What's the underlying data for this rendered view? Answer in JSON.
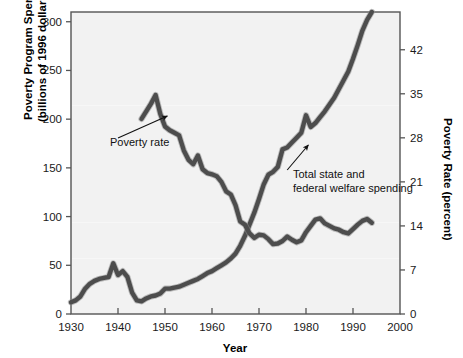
{
  "chart_data": {
    "type": "line",
    "title": "",
    "xlabel": "Year",
    "ylabel": "Poverty Program Spending (billions of 1996 dollars)",
    "y2label": "Poverty Rate (percent)",
    "xlim": [
      1930,
      2000
    ],
    "xticks": [
      1930,
      1940,
      1950,
      1960,
      1970,
      1980,
      1990,
      2000
    ],
    "xtick_labels": [
      "1930",
      "1940",
      "1950",
      "1960",
      "1970",
      "1980",
      "1990",
      "2000"
    ],
    "ylim": [
      0,
      310
    ],
    "yticks": [
      0,
      50,
      100,
      150,
      200,
      250,
      300
    ],
    "ytick_labels": [
      "0",
      "50",
      "100",
      "150",
      "200",
      "250",
      "300"
    ],
    "y2lim": [
      0,
      48
    ],
    "y2ticks": [
      0,
      7,
      14,
      21,
      28,
      35,
      42
    ],
    "y2tick_labels": [
      "0",
      "7",
      "14",
      "21",
      "28",
      "35",
      "42"
    ],
    "grid": false,
    "legend_position": "inline-annotations",
    "line_color": "#4d4d4d",
    "plot_background": "#f2f2f2",
    "series": [
      {
        "name": "Total state and federal welfare spending",
        "axis": "left",
        "units": "billions of 1996 dollars",
        "x": [
          1930,
          1931,
          1932,
          1933,
          1934,
          1935,
          1936,
          1937,
          1938,
          1939,
          1940,
          1941,
          1942,
          1943,
          1944,
          1945,
          1946,
          1947,
          1948,
          1949,
          1950,
          1951,
          1952,
          1953,
          1954,
          1955,
          1956,
          1957,
          1958,
          1959,
          1960,
          1961,
          1962,
          1963,
          1964,
          1965,
          1966,
          1967,
          1968,
          1969,
          1970,
          1971,
          1972,
          1973,
          1974,
          1975,
          1976,
          1977,
          1978,
          1979,
          1980,
          1981,
          1982,
          1983,
          1984,
          1985,
          1986,
          1987,
          1988,
          1989,
          1990,
          1991,
          1992,
          1993,
          1994
        ],
        "y": [
          12,
          14,
          18,
          26,
          31,
          34,
          36,
          37,
          38,
          52,
          40,
          44,
          38,
          22,
          14,
          13,
          16,
          18,
          19,
          21,
          26,
          26,
          27,
          28,
          30,
          32,
          34,
          36,
          39,
          42,
          44,
          47,
          50,
          53,
          57,
          62,
          70,
          80,
          92,
          104,
          118,
          133,
          143,
          146,
          151,
          169,
          171,
          176,
          181,
          186,
          204,
          192,
          196,
          202,
          208,
          215,
          222,
          231,
          240,
          249,
          262,
          276,
          291,
          302,
          310
        ]
      },
      {
        "name": "Poverty rate",
        "axis": "right",
        "units": "percent",
        "x": [
          1945,
          1946,
          1947,
          1948,
          1949,
          1950,
          1951,
          1952,
          1953,
          1954,
          1955,
          1956,
          1957,
          1958,
          1959,
          1960,
          1961,
          1962,
          1963,
          1964,
          1965,
          1966,
          1967,
          1968,
          1969,
          1970,
          1971,
          1972,
          1973,
          1974,
          1975,
          1976,
          1977,
          1978,
          1979,
          1980,
          1981,
          1982,
          1983,
          1984,
          1985,
          1986,
          1987,
          1988,
          1989,
          1990,
          1991,
          1992,
          1993,
          1994
        ],
        "y": [
          31.0,
          32.2,
          33.4,
          34.8,
          31.8,
          29.8,
          29.2,
          28.8,
          28.4,
          26.0,
          24.5,
          23.8,
          25.2,
          23.0,
          22.4,
          22.2,
          21.9,
          21.0,
          19.5,
          19.0,
          17.3,
          14.7,
          14.2,
          12.8,
          12.1,
          12.6,
          12.5,
          11.9,
          11.1,
          11.2,
          11.6,
          12.3,
          11.8,
          11.4,
          11.7,
          13.0,
          14.0,
          15.0,
          15.2,
          14.4,
          14.0,
          13.6,
          13.4,
          13.0,
          12.8,
          13.5,
          14.2,
          14.8,
          15.1,
          14.5
        ]
      }
    ],
    "annotations": [
      {
        "label": "Poverty rate",
        "text_x": 1936.5,
        "text_y_px": 142,
        "arrow_from": [
          1940.0,
          138
        ],
        "arrow_to": [
          1950.5,
          116
        ]
      },
      {
        "label_line1": "Total state and",
        "label_line2": "federal welfare spending",
        "text_x": 1971.5,
        "text_y_px": 175,
        "arrow_from": [
          1976.0,
          170
        ],
        "arrow_to": [
          1980.5,
          145
        ]
      }
    ]
  }
}
